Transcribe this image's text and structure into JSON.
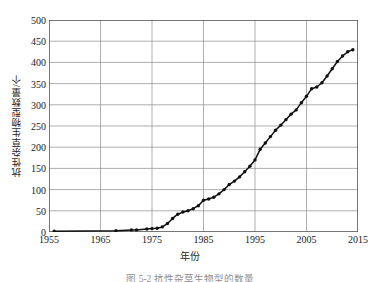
{
  "figure": {
    "caption": "图 5-2  抗性杂草生物型的数量",
    "axis_titles": {
      "x": "年份",
      "y": "抗性杂草生物型数量/个"
    },
    "colors": {
      "line": "#111111",
      "marker": "#111111",
      "grid": "#8c8c8c",
      "frame": "#555555",
      "text": "#1a1a1a",
      "background": "#ffffff"
    }
  },
  "chart_data": {
    "type": "line",
    "title": "",
    "subtitle": "",
    "xlabel": "年份",
    "ylabel": "抗性杂草生物型数量/个",
    "xlim": [
      1955,
      2015
    ],
    "ylim": [
      0,
      500
    ],
    "xticks": [
      1955,
      1965,
      1975,
      1985,
      1995,
      2005,
      2015
    ],
    "yticks": [
      0,
      50,
      100,
      150,
      200,
      250,
      300,
      350,
      400,
      450,
      500
    ],
    "xtick_labels": [
      "1955",
      "1965",
      "1975",
      "1985",
      "1995",
      "2005",
      "2015"
    ],
    "ytick_labels": [
      "0",
      "50",
      "100",
      "150",
      "200",
      "250",
      "300",
      "350",
      "400",
      "450",
      "500"
    ],
    "grid": true,
    "grid_axis": "both",
    "legend": null,
    "legend_position": "none",
    "markers": "filled-circle",
    "series": [
      {
        "name": "抗性杂草生物型数量",
        "x": [
          1956,
          1968,
          1971,
          1972,
          1974,
          1975,
          1976,
          1977,
          1978,
          1979,
          1980,
          1981,
          1982,
          1983,
          1984,
          1985,
          1986,
          1987,
          1988,
          1989,
          1990,
          1991,
          1992,
          1993,
          1994,
          1995,
          1996,
          1997,
          1998,
          1999,
          2000,
          2001,
          2002,
          2003,
          2004,
          2005,
          2006,
          2007,
          2008,
          2009,
          2010,
          2011,
          2012,
          2013,
          2014
        ],
        "values": [
          2,
          3,
          5,
          5,
          7,
          8,
          9,
          12,
          20,
          32,
          42,
          47,
          50,
          55,
          62,
          75,
          78,
          82,
          90,
          100,
          112,
          120,
          130,
          142,
          155,
          170,
          195,
          210,
          225,
          240,
          252,
          265,
          278,
          288,
          305,
          320,
          338,
          342,
          352,
          368,
          385,
          402,
          415,
          425,
          430
        ]
      }
    ]
  }
}
